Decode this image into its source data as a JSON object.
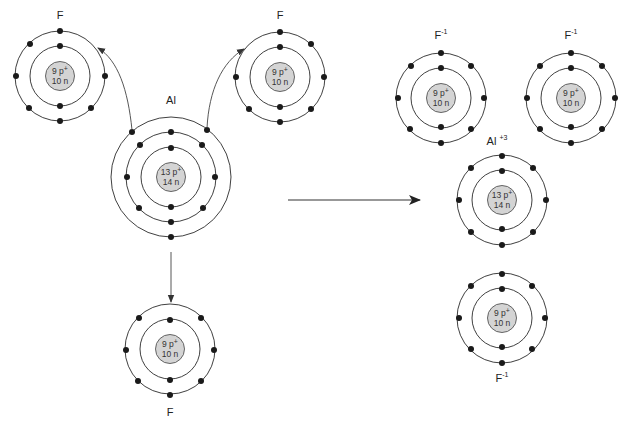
{
  "colors": {
    "background": "#ffffff",
    "nucleus_fill": "#d4d4d4",
    "electron": "#1a1a1a",
    "shell_stroke": "#2a2a2a"
  },
  "reactants": {
    "fluorine_top_left": {
      "label": "F",
      "protons": "9 p",
      "proton_sup": "+",
      "neutrons": "10 n",
      "shells": [
        2,
        7
      ]
    },
    "fluorine_top_right": {
      "label": "F",
      "protons": "9 p",
      "proton_sup": "+",
      "neutrons": "10 n",
      "shells": [
        2,
        7
      ]
    },
    "aluminum": {
      "label": "Al",
      "protons": "13 p",
      "proton_sup": "+",
      "neutrons": "14 n",
      "shells": [
        2,
        8,
        3
      ]
    },
    "fluorine_bottom": {
      "label": "F",
      "protons": "9 p",
      "proton_sup": "+",
      "neutrons": "10 n",
      "shells": [
        2,
        7
      ]
    }
  },
  "reaction_arrow": {
    "icon": "right-arrow-icon",
    "meaning": "yields"
  },
  "products": {
    "fluoride_ion_left": {
      "label": "F",
      "charge": "-1",
      "protons": "9 p",
      "proton_sup": "+",
      "neutrons": "10 n",
      "shells": [
        2,
        8
      ]
    },
    "fluoride_ion_right": {
      "label": "F",
      "charge": "-1",
      "protons": "9 p",
      "proton_sup": "+",
      "neutrons": "10 n",
      "shells": [
        2,
        8
      ]
    },
    "aluminum_ion": {
      "label": "Al",
      "charge": "+3",
      "protons": "13 p",
      "proton_sup": "+",
      "neutrons": "14 n",
      "shells": [
        2,
        8
      ]
    },
    "fluoride_ion_bottom": {
      "label": "F",
      "charge": "-1",
      "protons": "9 p",
      "proton_sup": "+",
      "neutrons": "10 n",
      "shells": [
        2,
        8
      ]
    }
  }
}
